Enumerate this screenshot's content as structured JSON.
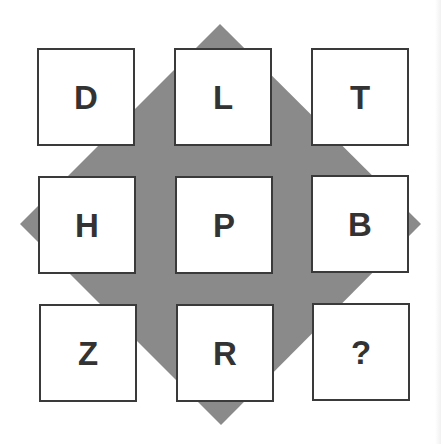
{
  "puzzle": {
    "title": "Letter grid puzzle",
    "colors": {
      "diamond": "#8a8a8a",
      "box_border": "#3a3a3a",
      "letter": "#333333",
      "background": "#ffffff"
    },
    "grid": [
      [
        "D",
        "L",
        "T"
      ],
      [
        "H",
        "P",
        "B"
      ],
      [
        "Z",
        "R",
        "?"
      ]
    ],
    "cells": {
      "r0c0": "D",
      "r0c1": "L",
      "r0c2": "T",
      "r1c0": "H",
      "r1c1": "P",
      "r1c2": "B",
      "r2c0": "Z",
      "r2c1": "R",
      "r2c2": "?"
    }
  }
}
